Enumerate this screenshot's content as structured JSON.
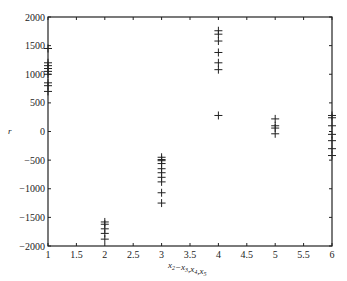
{
  "chart_data": {
    "type": "scatter",
    "title": "",
    "xlabel": "x2-x3,x4,x5",
    "xlabel_parts": [
      {
        "t": "x",
        "sub": "2"
      },
      {
        "t": "−x",
        "sub": "3"
      },
      {
        "t": ",x",
        "sub": "4"
      },
      {
        "t": ",x",
        "sub": "5"
      }
    ],
    "ylabel": "r",
    "xlim": [
      1,
      6
    ],
    "ylim": [
      -2000,
      2000
    ],
    "xticks": [
      1,
      1.5,
      2,
      2.5,
      3,
      3.5,
      4,
      4.5,
      5,
      5.5,
      6
    ],
    "xtick_labels": [
      "1",
      "1.5",
      "2",
      "2.5",
      "3",
      "3.5",
      "4",
      "4.5",
      "5",
      "5.5",
      "6"
    ],
    "yticks": [
      -2000,
      -1500,
      -1000,
      -500,
      0,
      500,
      1000,
      1500,
      2000
    ],
    "ytick_labels": [
      "-2000",
      "-1500",
      "-1000",
      "-500",
      "0",
      "500",
      "1000",
      "1500",
      "2000"
    ],
    "grid": false,
    "marker": "+",
    "marker_color": "#222222",
    "series": [
      {
        "name": "x=1",
        "x": 1,
        "values": [
          1450,
          1200,
          1150,
          1100,
          1050,
          1000,
          850,
          800,
          700
        ]
      },
      {
        "name": "x=2",
        "x": 2,
        "values": [
          -1580,
          -1620,
          -1700,
          -1780,
          -1880
        ]
      },
      {
        "name": "x=3",
        "x": 3,
        "values": [
          -450,
          -490,
          -510,
          -560,
          -650,
          -720,
          -800,
          -880,
          -1070,
          -1250
        ]
      },
      {
        "name": "x=4",
        "x": 4,
        "values": [
          1760,
          1700,
          1580,
          1380,
          1200,
          1080,
          280
        ]
      },
      {
        "name": "x=5",
        "x": 5,
        "values": [
          220,
          100,
          60,
          -40
        ]
      },
      {
        "name": "x=6",
        "x": 6,
        "values": [
          280,
          240,
          100,
          -50,
          -160,
          -300,
          -420
        ]
      }
    ]
  }
}
